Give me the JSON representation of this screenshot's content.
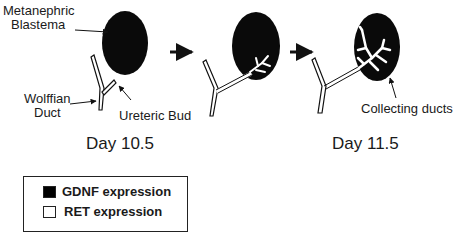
{
  "labels": {
    "metanephric_blastema": [
      "Metanephric",
      "Blastema"
    ],
    "wolffian_duct": [
      "Wolffian",
      "Duct"
    ],
    "ureteric_bud": "Ureteric Bud",
    "collecting_ducts": "Collecting ducts"
  },
  "stages": [
    {
      "label": "Day 10.5"
    },
    {
      "label": "Day 11.5"
    }
  ],
  "legend": {
    "items": [
      {
        "label": "GDNF expression",
        "color": "#000000"
      },
      {
        "label": "RET expression",
        "color": "#ffffff"
      }
    ]
  }
}
